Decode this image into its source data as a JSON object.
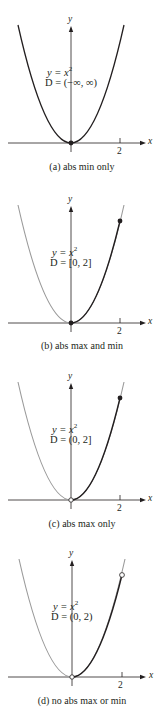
{
  "figure": {
    "panels": [
      {
        "id": "a",
        "equation": "y = x",
        "exponent": "2",
        "domain_label": "D = (−∞, ∞)",
        "caption": "(a) abs min only",
        "x_axis_label": "x",
        "y_axis_label": "y",
        "tick_label": "2",
        "endpoints": {
          "left": "filled",
          "right": "none"
        }
      },
      {
        "id": "b",
        "equation": "y = x",
        "exponent": "2",
        "domain_label": "D = [0, 2]",
        "caption": "(b) abs max and min",
        "x_axis_label": "x",
        "y_axis_label": "y",
        "tick_label": "2",
        "endpoints": {
          "left": "filled",
          "right": "filled"
        }
      },
      {
        "id": "c",
        "equation": "y = x",
        "exponent": "2",
        "domain_label": "D = (0, 2]",
        "caption": "(c) abs max only",
        "x_axis_label": "x",
        "y_axis_label": "y",
        "tick_label": "2",
        "endpoints": {
          "left": "open",
          "right": "filled"
        }
      },
      {
        "id": "d",
        "equation": "y = x",
        "exponent": "2",
        "domain_label": "D = (0, 2)",
        "caption": "(d) no abs max or min",
        "x_axis_label": "x",
        "y_axis_label": "y",
        "tick_label": "2",
        "endpoints": {
          "left": "open",
          "right": "open"
        }
      }
    ],
    "colors": {
      "highlight_curve": "#231f20",
      "faded_curve": "#9a9a9a",
      "axis": "#231f20"
    }
  }
}
